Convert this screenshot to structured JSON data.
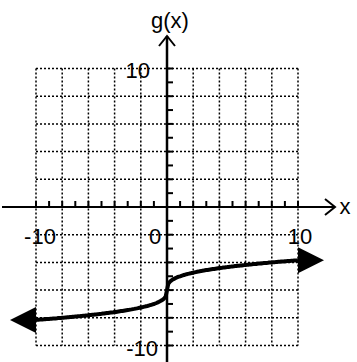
{
  "chart_data": {
    "type": "line",
    "title": "",
    "xlabel": "x",
    "ylabel": "g(x)",
    "xlim": [
      -10,
      10
    ],
    "ylim": [
      -10,
      10
    ],
    "grid": true,
    "grid_step": 2,
    "tick_labels": {
      "x": [
        "-10",
        "0",
        "10"
      ],
      "y": [
        "10",
        "-10"
      ]
    },
    "series": [
      {
        "name": "g(x)",
        "function": "cbrt(x) - 6",
        "x": [
          -10,
          -8,
          -6,
          -4,
          -2,
          -1,
          0,
          1,
          2,
          4,
          6,
          8,
          10
        ],
        "y": [
          -8.15,
          -8.0,
          -7.82,
          -7.59,
          -7.26,
          -7.0,
          -6.0,
          -5.0,
          -4.74,
          -4.41,
          -4.18,
          -4.0,
          -3.85
        ]
      }
    ],
    "arrows_at_ends": true
  },
  "labels": {
    "ylabel": "g(x)",
    "xlabel": "x",
    "y_top": "10",
    "y_bottom": "-10",
    "x_left": "-10",
    "x_zero": "0",
    "x_right": "10"
  }
}
